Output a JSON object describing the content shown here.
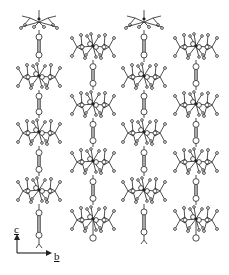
{
  "figure": {
    "columns": [
      {
        "x": 39,
        "clusters": [
          22,
          76,
          132,
          190
        ],
        "bonds": [
          [
            30,
            62
          ],
          [
            90,
            118
          ],
          [
            146,
            176
          ],
          [
            204,
            244
          ]
        ],
        "top_partial": true,
        "bottom": "fork"
      },
      {
        "x": 93,
        "clusters": [
          46,
          104,
          161,
          219
        ],
        "bonds": [
          [
            60,
            90
          ],
          [
            118,
            147
          ],
          [
            175,
            205
          ]
        ],
        "top_partial": false,
        "bottom": "circle"
      },
      {
        "x": 144,
        "clusters": [
          22,
          76,
          132,
          190
        ],
        "bonds": [
          [
            30,
            62
          ],
          [
            90,
            118
          ],
          [
            146,
            176
          ],
          [
            204,
            240
          ]
        ],
        "top_partial": true,
        "bottom": "fork"
      },
      {
        "x": 196,
        "clusters": [
          46,
          104,
          161,
          219
        ],
        "bonds": [
          [
            60,
            90
          ],
          [
            118,
            147
          ],
          [
            175,
            205
          ]
        ],
        "top_partial": false,
        "bottom": "circle"
      }
    ],
    "colors": {
      "line": "#222222",
      "background": "#ffffff"
    }
  },
  "axes": {
    "vertical_label": "c",
    "horizontal_label": "b"
  }
}
